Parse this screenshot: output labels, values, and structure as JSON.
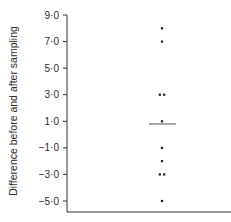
{
  "chart_data": {
    "type": "scatter",
    "subtype": "dot-plot",
    "title": "",
    "xlabel": "",
    "ylabel": "Difference before and after sampling",
    "ylim": [
      -6.0,
      9.0
    ],
    "yticks": [
      9.0,
      7.0,
      5.0,
      3.0,
      1.0,
      -1.0,
      -3.0,
      -5.0
    ],
    "ytick_labels": [
      "9·0",
      "7·0",
      "5·0",
      "3·0",
      "1·0",
      "−1·0",
      "−3·0",
      "−5·0"
    ],
    "grid": false,
    "legend": null,
    "points": [
      {
        "x": 0,
        "y": 8.0
      },
      {
        "x": 0,
        "y": 7.0
      },
      {
        "x": -1,
        "y": 3.0
      },
      {
        "x": 1,
        "y": 3.0
      },
      {
        "x": 0,
        "y": 1.0
      },
      {
        "x": 0,
        "y": -1.0
      },
      {
        "x": 0,
        "y": -2.0
      },
      {
        "x": -1,
        "y": -3.0
      },
      {
        "x": 1,
        "y": -3.0
      },
      {
        "x": 0,
        "y": -5.0
      }
    ],
    "values": [
      8.0,
      7.0,
      3.0,
      3.0,
      1.0,
      -1.0,
      -2.0,
      -3.0,
      -3.0,
      -5.0
    ],
    "mean_line": {
      "value": 0.8,
      "label": ""
    },
    "colors": {
      "points": "#1a1a1a",
      "axis": "#333333",
      "mean_line": "#555555"
    }
  }
}
